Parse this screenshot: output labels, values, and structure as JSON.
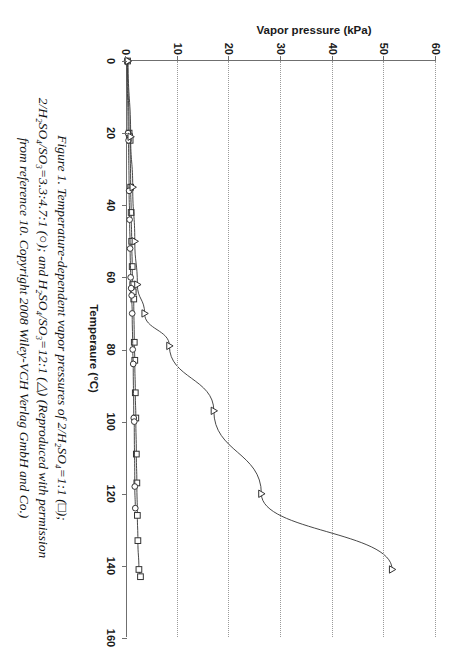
{
  "figure": {
    "caption_lines": [
      "Figure 1. Temperature-dependent vapor pressures of 2/H₂SO₄=1:1 (□);",
      "2/H₂SO₄/SO₃=3.3:4.7:1 (○); and H₂SO₄/SO₃=12:1 (△) (Reproduced with permission",
      "from reference 10. Copyright 2008 Wiley-VCH Verlag GmbH and Co.)"
    ]
  },
  "chart_data": {
    "type": "line",
    "title": "",
    "xlabel": "Temperaure (°C)",
    "ylabel": "Vapor pressure (kPa)",
    "xlim": [
      0,
      160
    ],
    "ylim": [
      0,
      60
    ],
    "xticks": [
      0,
      20,
      40,
      60,
      80,
      100,
      120,
      140,
      160
    ],
    "xtick_labels": [
      "0",
      "20",
      "40",
      "60",
      "80",
      "100",
      "120",
      "140",
      "160"
    ],
    "yticks": [
      0,
      10,
      20,
      30,
      40,
      50,
      60
    ],
    "ytick_labels": [
      "0",
      "10",
      "20",
      "30",
      "40",
      "50",
      "60"
    ],
    "grid": "horizontal-dotted",
    "legend_position": "none",
    "series": [
      {
        "name": "2/H₂SO₄ = 1:1",
        "marker": "square",
        "legend_symbol": "□",
        "color": "#333333",
        "x": [
          0,
          20,
          21,
          22,
          35,
          42,
          50,
          57,
          62,
          64,
          66,
          78,
          83,
          92,
          99,
          109,
          117,
          126,
          133,
          141,
          143
        ],
        "y": [
          0.3,
          0.6,
          0.7,
          0.8,
          0.9,
          1.0,
          1.1,
          1.2,
          1.3,
          1.4,
          1.5,
          1.6,
          1.7,
          1.8,
          1.9,
          2.0,
          2.1,
          2.2,
          2.3,
          2.5,
          2.8
        ]
      },
      {
        "name": "2/H₂SO₄/SO₃ = 3.3:4.7:1",
        "marker": "circle",
        "legend_symbol": "○",
        "color": "#333333",
        "x": [
          0,
          20,
          22,
          36,
          44,
          52,
          60,
          63,
          65,
          70,
          80,
          84,
          99,
          100,
          118,
          124
        ],
        "y": [
          0.2,
          0.4,
          0.5,
          0.6,
          0.7,
          0.8,
          0.9,
          1.0,
          1.1,
          1.2,
          1.3,
          1.4,
          1.5,
          1.6,
          1.7,
          1.8
        ]
      },
      {
        "name": "H₂SO₄/SO₃ = 12:1",
        "marker": "triangle",
        "legend_symbol": "△",
        "color": "#333333",
        "x": [
          0,
          21,
          35,
          50,
          62,
          70,
          79,
          97,
          120,
          141
        ],
        "y": [
          0.4,
          0.9,
          1.3,
          1.7,
          2.2,
          3.6,
          8.4,
          17.0,
          26.2,
          51.5
        ]
      }
    ]
  }
}
